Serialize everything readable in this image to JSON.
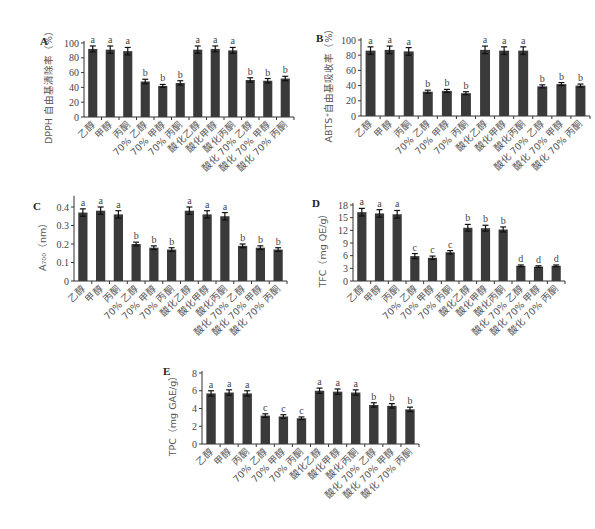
{
  "chart_data": [
    {
      "id": "A",
      "type": "bar",
      "panel_label": "A",
      "ylabel": "DPPH 自由基清除率（%）",
      "xlabel": "",
      "ylim": [
        0,
        100
      ],
      "yticks": [
        0,
        20,
        40,
        60,
        80,
        100
      ],
      "categories": [
        "乙醇",
        "甲醇",
        "丙酮",
        "70% 乙醇",
        "70% 甲醇",
        "70% 丙酮",
        "酸化乙醇",
        "酸化甲醇",
        "酸化丙酮",
        "酸化 70% 乙醇",
        "酸化 70% 甲醇",
        "酸化 70% 丙酮"
      ],
      "values": [
        92,
        91,
        89,
        48,
        42,
        46,
        91,
        92,
        90,
        50,
        49,
        52
      ],
      "errors": [
        4,
        5,
        5,
        3,
        2,
        3,
        5,
        4,
        4,
        3,
        3,
        3
      ],
      "significance": [
        "a",
        "a",
        "a",
        "b",
        "b",
        "b",
        "a",
        "a",
        "a",
        "b",
        "b",
        "b"
      ]
    },
    {
      "id": "B",
      "type": "bar",
      "panel_label": "B",
      "ylabel": "ABTS⁺自由基吸收率（%）",
      "xlabel": "",
      "ylim": [
        0,
        100
      ],
      "yticks": [
        0,
        20,
        40,
        60,
        80,
        100
      ],
      "categories": [
        "乙醇",
        "甲醇",
        "丙酮",
        "70% 乙醇",
        "70% 甲醇",
        "70% 丙酮",
        "酸化乙醇",
        "酸化甲醇",
        "酸化丙酮",
        "酸化 70% 乙醇",
        "酸化 70% 甲醇",
        "酸化 70% 丙酮"
      ],
      "values": [
        86,
        87,
        85,
        32,
        33,
        30,
        87,
        86,
        86,
        39,
        42,
        40
      ],
      "errors": [
        5,
        5,
        5,
        2,
        2,
        2,
        5,
        5,
        5,
        2,
        2,
        2
      ],
      "significance": [
        "a",
        "a",
        "a",
        "b",
        "b",
        "b",
        "a",
        "a",
        "a",
        "b",
        "b",
        "b"
      ]
    },
    {
      "id": "C",
      "type": "bar",
      "panel_label": "C",
      "ylabel": "A₇₀₀（nm）",
      "xlabel": "",
      "ylim": [
        0,
        0.45
      ],
      "yticks": [
        0,
        0.1,
        0.2,
        0.3,
        0.4
      ],
      "categories": [
        "乙醇",
        "甲醇",
        "丙酮",
        "70% 乙醇",
        "70% 甲醇",
        "70% 丙酮",
        "酸化乙醇",
        "酸化甲醇",
        "酸化丙酮",
        "酸化 70% 乙醇",
        "酸化 70% 甲醇",
        "酸化 70% 丙酮"
      ],
      "values": [
        0.37,
        0.38,
        0.36,
        0.2,
        0.18,
        0.17,
        0.38,
        0.36,
        0.35,
        0.19,
        0.18,
        0.17
      ],
      "errors": [
        0.02,
        0.02,
        0.02,
        0.01,
        0.01,
        0.01,
        0.02,
        0.02,
        0.02,
        0.01,
        0.01,
        0.01
      ],
      "significance": [
        "a",
        "a",
        "a",
        "b",
        "b",
        "b",
        "a",
        "a",
        "a",
        "b",
        "b",
        "b"
      ]
    },
    {
      "id": "D",
      "type": "bar",
      "panel_label": "D",
      "ylabel": "TFC（mg QE/g）",
      "xlabel": "",
      "ylim": [
        0,
        18
      ],
      "yticks": [
        0,
        3,
        6,
        9,
        12,
        15,
        18
      ],
      "categories": [
        "乙醇",
        "甲醇",
        "丙酮",
        "70% 乙醇",
        "70% 甲醇",
        "70% 丙酮",
        "酸化乙醇",
        "酸化甲醇",
        "酸化丙酮",
        "酸化 70% 乙醇",
        "酸化 70% 甲醇",
        "酸化 70% 丙酮"
      ],
      "values": [
        16.3,
        16.0,
        15.8,
        5.9,
        5.5,
        6.8,
        12.6,
        12.5,
        12.2,
        3.6,
        3.4,
        3.6
      ],
      "errors": [
        0.9,
        0.9,
        0.9,
        0.6,
        0.4,
        0.4,
        0.8,
        0.7,
        0.6,
        0.2,
        0.2,
        0.2
      ],
      "significance": [
        "a",
        "a",
        "a",
        "c",
        "c",
        "c",
        "b",
        "b",
        "b",
        "d",
        "d",
        "d"
      ]
    },
    {
      "id": "E",
      "type": "bar",
      "panel_label": "E",
      "ylabel": "TPC（mg GAE/g）",
      "xlabel": "",
      "ylim": [
        0,
        8
      ],
      "yticks": [
        0,
        2,
        4,
        6,
        8
      ],
      "categories": [
        "乙醇",
        "甲醇",
        "丙酮",
        "70% 乙醇",
        "70% 甲醇",
        "70% 丙酮",
        "酸化乙醇",
        "酸化甲醇",
        "酸化丙酮",
        "酸化 70% 乙醇",
        "酸化 70% 甲醇",
        "酸化 70% 丙酮"
      ],
      "values": [
        5.7,
        5.8,
        5.7,
        3.2,
        3.1,
        2.9,
        6.0,
        5.9,
        5.8,
        4.4,
        4.3,
        3.9
      ],
      "errors": [
        0.3,
        0.3,
        0.3,
        0.2,
        0.2,
        0.15,
        0.3,
        0.3,
        0.3,
        0.25,
        0.25,
        0.25
      ],
      "significance": [
        "a",
        "a",
        "a",
        "c",
        "c",
        "c",
        "a",
        "a",
        "a",
        "b",
        "b",
        "b"
      ]
    }
  ],
  "colors": {
    "bar": "#3a3a3a",
    "axis": "#333333",
    "text": "#444444"
  }
}
